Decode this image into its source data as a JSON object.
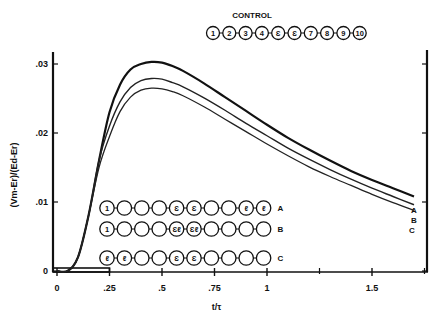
{
  "chart_data": {
    "type": "line",
    "title": "",
    "xlabel": "t/τ",
    "ylabel": "(Vm-Er)/(Ed-Er)",
    "xlim": [
      0,
      1.75
    ],
    "ylim": [
      0,
      0.032
    ],
    "x_ticks": [
      "0",
      ".25",
      ".5",
      ".75",
      "1",
      "1.5"
    ],
    "x_tick_values": [
      0,
      0.25,
      0.5,
      0.75,
      1.0,
      1.5
    ],
    "y_ticks": [
      "0",
      ".01",
      ".02",
      ".03"
    ],
    "y_tick_values": [
      0,
      0.01,
      0.02,
      0.03
    ],
    "grid": false,
    "x": [
      0,
      0.05,
      0.1,
      0.15,
      0.2,
      0.25,
      0.3,
      0.35,
      0.4,
      0.45,
      0.5,
      0.55,
      0.6,
      0.7,
      0.8,
      0.9,
      1.0,
      1.1,
      1.2,
      1.3,
      1.4,
      1.5,
      1.6,
      1.7
    ],
    "series": [
      {
        "name": "A",
        "values": [
          0,
          0,
          0.002,
          0.008,
          0.016,
          0.023,
          0.027,
          0.0292,
          0.03,
          0.0303,
          0.0302,
          0.0297,
          0.029,
          0.0272,
          0.0252,
          0.0232,
          0.0212,
          0.0193,
          0.0176,
          0.016,
          0.0145,
          0.0132,
          0.012,
          0.0108
        ]
      },
      {
        "name": "B",
        "values": [
          0,
          0,
          0.002,
          0.008,
          0.016,
          0.021,
          0.0245,
          0.0266,
          0.0276,
          0.0279,
          0.0278,
          0.0273,
          0.0267,
          0.0251,
          0.0233,
          0.0214,
          0.0196,
          0.0178,
          0.0162,
          0.0147,
          0.0133,
          0.012,
          0.0108,
          0.0096
        ]
      },
      {
        "name": "C",
        "values": [
          0,
          0,
          0.002,
          0.008,
          0.015,
          0.0195,
          0.0231,
          0.0252,
          0.0262,
          0.0265,
          0.0264,
          0.026,
          0.0254,
          0.0238,
          0.022,
          0.0202,
          0.0184,
          0.0167,
          0.0151,
          0.0137,
          0.0124,
          0.0111,
          0.0099,
          0.0088
        ]
      }
    ],
    "annotations": {
      "control_label": "CONTROL",
      "control_chain": [
        "1",
        "2",
        "3",
        "4",
        "Ɛ",
        "Ɛ",
        "7",
        "8",
        "9",
        "10"
      ],
      "row_A": [
        "1",
        "",
        "",
        "",
        "Ɛ",
        "Ɛ",
        "",
        "",
        "ℓ",
        "ℓ"
      ],
      "row_B": [
        "1",
        "",
        "",
        "",
        "Ɛℓ",
        "Ɛℓ",
        "",
        "",
        "",
        ""
      ],
      "row_C": [
        "ℓ",
        "ℓ",
        "",
        "",
        "Ɛ",
        "Ɛ",
        "",
        "",
        "",
        ""
      ],
      "row_labels": [
        "A",
        "B",
        "C"
      ],
      "curve_end_labels": [
        "A",
        "B",
        "C"
      ]
    }
  }
}
